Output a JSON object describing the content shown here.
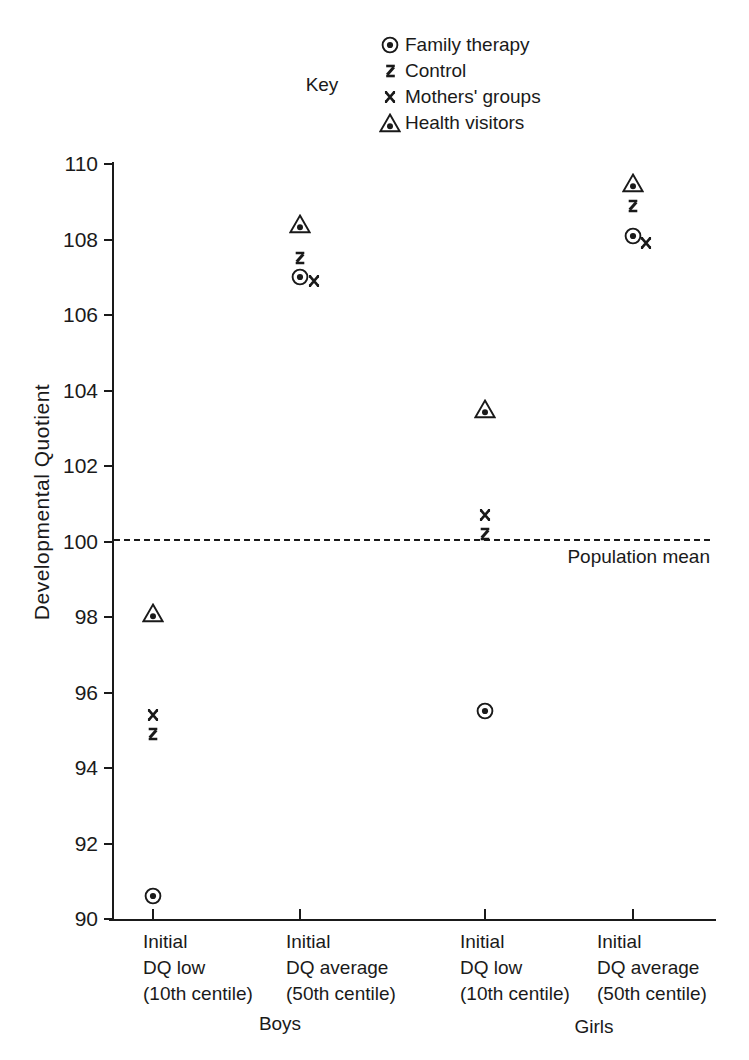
{
  "figure": {
    "background": "#ffffff",
    "ink_color": "#1a1a1a"
  },
  "chart_data": {
    "type": "scatter",
    "title": "",
    "key_title": "Key",
    "legend_position": "top-center",
    "xlabel": "",
    "ylabel": "Developmental Quotient",
    "ylim": [
      90,
      110
    ],
    "yticks": [
      90,
      92,
      94,
      96,
      98,
      100,
      102,
      104,
      106,
      108,
      110
    ],
    "grid": false,
    "reference_line": {
      "value": 100,
      "label": "Population mean",
      "style": "dashed"
    },
    "categories": [
      {
        "lines": [
          "Initial",
          "DQ low",
          "(10th centile)"
        ],
        "group": "Boys"
      },
      {
        "lines": [
          "Initial",
          "DQ average",
          "(50th centile)"
        ],
        "group": "Boys"
      },
      {
        "lines": [
          "Initial",
          "DQ low",
          "(10th centile)"
        ],
        "group": "Girls"
      },
      {
        "lines": [
          "Initial",
          "DQ average",
          "(50th centile)"
        ],
        "group": "Girls"
      }
    ],
    "group_labels": [
      "Boys",
      "Girls"
    ],
    "series": [
      {
        "name": "Family therapy",
        "marker": "circle-dot",
        "values": [
          90.6,
          107.0,
          95.5,
          108.1
        ]
      },
      {
        "name": "Control",
        "marker": "z-hatch",
        "values": [
          94.9,
          107.5,
          100.2,
          108.9
        ]
      },
      {
        "name": "Mothers' groups",
        "marker": "x-cross",
        "values": [
          95.4,
          106.9,
          100.7,
          107.9
        ]
      },
      {
        "name": "Health visitors",
        "marker": "triangle-dot",
        "values": [
          98.1,
          108.4,
          103.5,
          109.5
        ]
      }
    ]
  }
}
